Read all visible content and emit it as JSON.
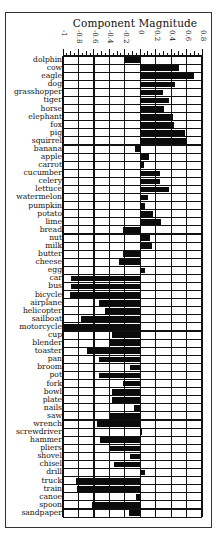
{
  "chart_data": {
    "type": "bar",
    "orientation": "horizontal",
    "title": "Component Magnitude",
    "xlabel": "",
    "ylabel": "",
    "xlim": [
      -1,
      0.8
    ],
    "xticks": [
      -1,
      -0.8,
      -0.6,
      -0.4,
      -0.2,
      0,
      0.2,
      0.4,
      0.6,
      0.8
    ],
    "xtick_labels": [
      "-1",
      "-0.8",
      "-0.6",
      "-0.4",
      "-0.2",
      "0",
      "0.2",
      "0.4",
      "0.6",
      "0.8"
    ],
    "grid": true,
    "legend": null,
    "categories": [
      "dolphin",
      "cow",
      "eagle",
      "dog",
      "grasshopper",
      "tiger",
      "horse",
      "elephant",
      "fox",
      "pig",
      "squirrel",
      "banana",
      "apple",
      "carrot",
      "cucumber",
      "celery",
      "lettuce",
      "watermelon",
      "pumpkin",
      "potato",
      "lime",
      "bread",
      "nut",
      "milk",
      "butter",
      "cheese",
      "egg",
      "car",
      "bus",
      "bicycle",
      "airplane",
      "helicopter",
      "sailboat",
      "motorcycle",
      "cup",
      "blender",
      "toaster",
      "pan",
      "broom",
      "pot",
      "fork",
      "bowl",
      "plate",
      "nails",
      "saw",
      "wrench",
      "screwdriver",
      "hammer",
      "pliers",
      "shovel",
      "chisel",
      "drill",
      "truck",
      "train",
      "canoe",
      "spoon",
      "sandpaper"
    ],
    "values": [
      -0.2,
      0.5,
      0.7,
      0.45,
      0.29,
      0.37,
      0.31,
      0.42,
      0.44,
      0.58,
      0.61,
      -0.07,
      0.12,
      0.05,
      0.25,
      0.25,
      0.37,
      0.1,
      0.06,
      0.17,
      0.27,
      -0.22,
      0.13,
      0.15,
      -0.22,
      -0.27,
      0.06,
      -0.9,
      -0.9,
      -0.91,
      -0.54,
      -0.45,
      -0.77,
      -0.99,
      -0.37,
      -0.39,
      -0.69,
      -0.54,
      -0.13,
      -0.53,
      -0.22,
      -0.37,
      -0.37,
      -0.08,
      -0.39,
      -0.56,
      0.02,
      -0.52,
      -0.39,
      -0.13,
      -0.34,
      0.06,
      -0.83,
      -0.82,
      -0.06,
      -0.63,
      -0.14
    ],
    "bar_color": "#0b0b0b"
  }
}
